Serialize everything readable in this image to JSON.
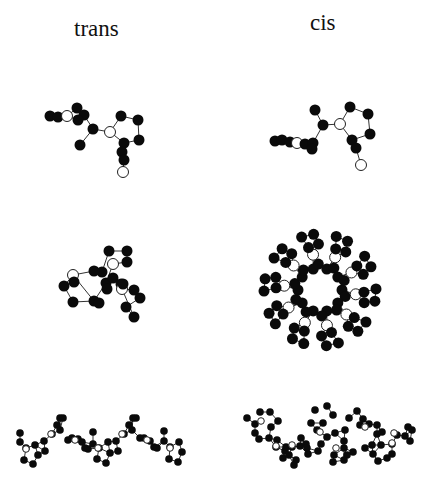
{
  "figure": {
    "columns": [
      {
        "id": "trans",
        "label": "trans"
      },
      {
        "id": "cis",
        "label": "cis"
      }
    ],
    "panels": [
      {
        "id": "trans-monomer",
        "r": 5.5,
        "atoms": [
          [
            50,
            116,
            1
          ],
          [
            58,
            117,
            1
          ],
          [
            67,
            116,
            0
          ],
          [
            77,
            108,
            1
          ],
          [
            84,
            115,
            1
          ],
          [
            78,
            120,
            1
          ],
          [
            93,
            129,
            1
          ],
          [
            80,
            145,
            1
          ],
          [
            110,
            132,
            0
          ],
          [
            121,
            116,
            1
          ],
          [
            138,
            120,
            1
          ],
          [
            139,
            140,
            1
          ],
          [
            124,
            143,
            1
          ],
          [
            122,
            152,
            1
          ],
          [
            123,
            172,
            0
          ],
          [
            124,
            160,
            1
          ]
        ],
        "bonds": [
          [
            0,
            1
          ],
          [
            1,
            2
          ],
          [
            2,
            3
          ],
          [
            2,
            5
          ],
          [
            3,
            4
          ],
          [
            4,
            6
          ],
          [
            6,
            7
          ],
          [
            6,
            8
          ],
          [
            8,
            9
          ],
          [
            9,
            10
          ],
          [
            10,
            11
          ],
          [
            11,
            12
          ],
          [
            12,
            8
          ],
          [
            12,
            13
          ],
          [
            13,
            15
          ],
          [
            15,
            14
          ]
        ]
      },
      {
        "id": "cis-monomer",
        "r": 5.5,
        "atoms": [
          [
            275,
            141,
            1
          ],
          [
            282,
            140,
            1
          ],
          [
            290,
            142,
            1
          ],
          [
            297,
            143,
            0
          ],
          [
            305,
            144,
            1
          ],
          [
            313,
            143,
            1
          ],
          [
            312,
            149,
            1
          ],
          [
            315,
            110,
            1
          ],
          [
            323,
            125,
            1
          ],
          [
            340,
            124,
            0
          ],
          [
            350,
            107,
            1
          ],
          [
            368,
            114,
            1
          ],
          [
            370,
            134,
            1
          ],
          [
            352,
            140,
            1
          ],
          [
            356,
            148,
            1
          ],
          [
            361,
            165,
            0
          ]
        ],
        "bonds": [
          [
            0,
            1
          ],
          [
            1,
            2
          ],
          [
            2,
            3
          ],
          [
            3,
            4
          ],
          [
            4,
            5
          ],
          [
            5,
            6
          ],
          [
            5,
            8
          ],
          [
            7,
            8
          ],
          [
            8,
            9
          ],
          [
            9,
            10
          ],
          [
            10,
            11
          ],
          [
            11,
            12
          ],
          [
            12,
            13
          ],
          [
            13,
            9
          ],
          [
            13,
            14
          ],
          [
            14,
            15
          ]
        ]
      },
      {
        "id": "trans-helix",
        "r": 5.5,
        "atoms": [
          [
            109,
            251,
            1
          ],
          [
            127,
            251,
            1
          ],
          [
            127,
            262,
            1
          ],
          [
            102,
            272,
            1
          ],
          [
            113,
            264,
            0
          ],
          [
            94,
            271,
            1
          ],
          [
            73,
            275,
            0
          ],
          [
            74,
            282,
            1
          ],
          [
            64,
            286,
            1
          ],
          [
            73,
            302,
            1
          ],
          [
            94,
            301,
            1
          ],
          [
            106,
            283,
            1
          ],
          [
            107,
            289,
            1
          ],
          [
            113,
            278,
            1
          ],
          [
            121,
            284,
            1
          ],
          [
            122,
            289,
            0
          ],
          [
            134,
            290,
            1
          ],
          [
            140,
            298,
            1
          ],
          [
            126,
            307,
            1
          ],
          [
            134,
            317,
            1
          ],
          [
            99,
            303,
            1
          ],
          [
            123,
            284,
            1
          ]
        ],
        "bonds": [
          [
            0,
            1
          ],
          [
            1,
            2
          ],
          [
            2,
            4
          ],
          [
            0,
            3
          ],
          [
            3,
            5
          ],
          [
            4,
            11
          ],
          [
            5,
            6
          ],
          [
            6,
            8
          ],
          [
            8,
            7
          ],
          [
            8,
            9
          ],
          [
            9,
            10
          ],
          [
            10,
            6
          ],
          [
            10,
            11
          ],
          [
            11,
            12
          ],
          [
            12,
            13
          ],
          [
            13,
            14
          ],
          [
            14,
            15
          ],
          [
            14,
            21
          ],
          [
            15,
            16
          ],
          [
            16,
            17
          ],
          [
            17,
            18
          ],
          [
            18,
            19
          ],
          [
            19,
            15
          ],
          [
            10,
            20
          ]
        ]
      },
      {
        "id": "cis-ring",
        "r": 5.5,
        "ring": {
          "cx": 320,
          "cy": 290,
          "units": 10,
          "rInner": 22,
          "rOuter": 56
        }
      },
      {
        "id": "trans-chain",
        "r": 3.8,
        "atoms": [
          [
            20,
            433
          ],
          [
            20,
            442
          ],
          [
            26,
            448
          ],
          [
            24,
            460
          ],
          [
            33,
            464
          ],
          [
            38,
            455
          ],
          [
            35,
            445
          ],
          [
            44,
            441
          ],
          [
            45,
            451
          ],
          [
            52,
            434
          ],
          [
            57,
            425
          ],
          [
            60,
            418
          ],
          [
            63,
            418
          ],
          [
            60,
            430
          ],
          [
            68,
            440
          ],
          [
            72,
            438
          ],
          [
            78,
            439
          ],
          [
            82,
            442
          ],
          [
            85,
            448
          ],
          [
            88,
            449
          ],
          [
            93,
            444
          ],
          [
            93,
            432
          ],
          [
            99,
            448
          ],
          [
            97,
            459
          ],
          [
            106,
            463
          ],
          [
            110,
            453
          ],
          [
            108,
            442
          ],
          [
            116,
            441
          ],
          [
            118,
            451
          ],
          [
            124,
            434
          ],
          [
            129,
            425
          ],
          [
            133,
            418
          ],
          [
            136,
            418
          ],
          [
            132,
            430
          ],
          [
            140,
            438
          ],
          [
            144,
            438
          ],
          [
            150,
            441
          ],
          [
            154,
            447
          ],
          [
            157,
            448
          ],
          [
            164,
            441
          ],
          [
            164,
            431
          ],
          [
            170,
            447
          ],
          [
            169,
            459
          ],
          [
            178,
            462
          ],
          [
            182,
            452
          ],
          [
            179,
            442
          ]
        ],
        "open": [
          [
            26,
            449
          ],
          [
            51,
            434
          ],
          [
            75,
            440
          ],
          [
            98,
            448
          ],
          [
            122,
            434
          ],
          [
            147,
            440
          ],
          [
            170,
            448
          ]
        ]
      },
      {
        "id": "cis-chain",
        "r": 3.8,
        "atoms": [
          [
            247,
            418
          ],
          [
            255,
            424
          ],
          [
            255,
            433
          ],
          [
            259,
            439
          ],
          [
            260,
            412
          ],
          [
            270,
            412
          ],
          [
            278,
            421
          ],
          [
            271,
            427
          ],
          [
            269,
            438
          ],
          [
            277,
            440
          ],
          [
            276,
            447
          ],
          [
            285,
            451
          ],
          [
            283,
            458
          ],
          [
            289,
            455
          ],
          [
            296,
            460
          ],
          [
            286,
            447
          ],
          [
            292,
            447
          ],
          [
            300,
            446
          ],
          [
            301,
            438
          ],
          [
            306,
            444
          ],
          [
            308,
            454
          ],
          [
            294,
            465
          ],
          [
            307,
            448
          ],
          [
            311,
            423
          ],
          [
            315,
            410
          ],
          [
            327,
            406
          ],
          [
            333,
            415
          ],
          [
            323,
            423
          ],
          [
            317,
            430
          ],
          [
            321,
            444
          ],
          [
            318,
            451
          ],
          [
            327,
            437
          ],
          [
            335,
            433
          ],
          [
            345,
            430
          ],
          [
            344,
            441
          ],
          [
            344,
            448
          ],
          [
            347,
            455
          ],
          [
            334,
            455
          ],
          [
            333,
            462
          ],
          [
            344,
            460
          ],
          [
            353,
            452
          ],
          [
            349,
            418
          ],
          [
            357,
            411
          ],
          [
            363,
            419
          ],
          [
            360,
            425
          ],
          [
            369,
            424
          ],
          [
            377,
            425
          ],
          [
            377,
            434
          ],
          [
            382,
            432
          ],
          [
            372,
            445
          ],
          [
            373,
            454
          ],
          [
            365,
            448
          ],
          [
            381,
            445
          ],
          [
            392,
            454
          ],
          [
            387,
            458
          ],
          [
            378,
            461
          ],
          [
            392,
            444
          ],
          [
            397,
            435
          ],
          [
            405,
            436
          ],
          [
            408,
            427
          ],
          [
            412,
            430
          ],
          [
            410,
            441
          ]
        ],
        "open": [
          [
            261,
            421
          ],
          [
            276,
            446
          ],
          [
            292,
            445
          ],
          [
            320,
            432
          ],
          [
            336,
            448
          ],
          [
            365,
            427
          ],
          [
            392,
            443
          ],
          [
            394,
            433
          ]
        ]
      }
    ]
  }
}
